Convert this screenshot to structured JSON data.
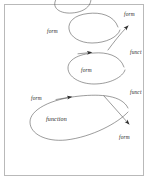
{
  "figure": {
    "background_color": "#ffffff",
    "stroke_color": "#4a4a4a",
    "border_color": "#b9b9b9",
    "text_color": "#1a1a1a"
  },
  "labels": {
    "top_right_form": "form",
    "upper_loop_form": "form",
    "right_upper_funct": "funct",
    "middle_loop_form": "form",
    "right_middle_funct": "funct",
    "left_lower_form": "form",
    "large_loop_function": "function",
    "bottom_right_form": "form"
  },
  "elements": {
    "loops": [
      "upper-loop",
      "middle-loop",
      "large-loop",
      "clipped-top-loop"
    ],
    "arrowheads": [
      "upper-diagonal-arrow",
      "middle-loop-arrow",
      "large-loop-arrow",
      "lower-diagonal-arrow"
    ],
    "diagonal_line": "crossing-diagonal"
  }
}
